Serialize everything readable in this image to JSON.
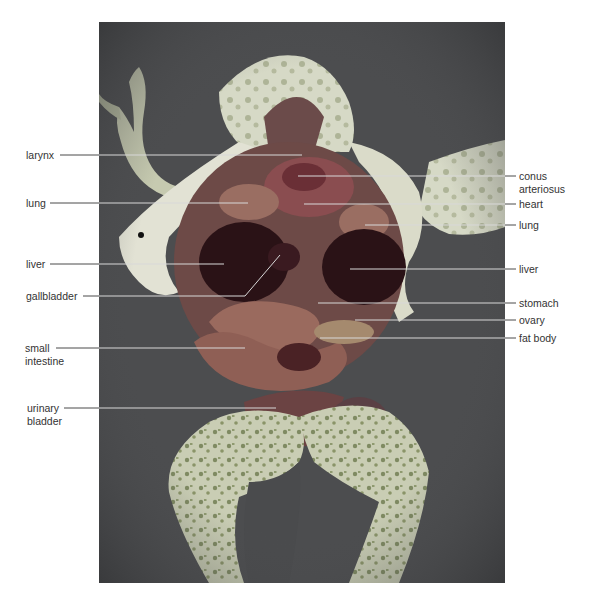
{
  "figure": {
    "colors": {
      "background": "#ffffff",
      "photo_background": "#4a4b4d",
      "skin": "#c9cdb4",
      "skin_spots": "#7f8a62",
      "organ_dark": "#2a1216",
      "organ_red": "#8a4a4a",
      "intestine": "#9a6a5e",
      "leader_line": "#4a4a4a",
      "leader_line_on_photo": "#d8d8d8"
    },
    "labels_left": [
      {
        "id": "larynx",
        "text": "larynx",
        "y": 155
      },
      {
        "id": "lung-left",
        "text": "lung",
        "y": 203
      },
      {
        "id": "liver-left",
        "text": "liver",
        "y": 264
      },
      {
        "id": "gallbladder",
        "text": "gallbladder",
        "y": 296
      },
      {
        "id": "small-intestine",
        "line1": "small",
        "line2": "intestine",
        "y": 348
      },
      {
        "id": "urinary-bladder",
        "line1": "urinary",
        "line2": "bladder",
        "y": 408
      }
    ],
    "labels_right": [
      {
        "id": "conus-arteriosus",
        "line1": "conus",
        "line2": "arteriosus",
        "y": 176
      },
      {
        "id": "heart",
        "text": "heart",
        "y": 204
      },
      {
        "id": "lung-right",
        "text": "lung",
        "y": 225
      },
      {
        "id": "liver-right",
        "text": "liver",
        "y": 269
      },
      {
        "id": "stomach",
        "text": "stomach",
        "y": 303
      },
      {
        "id": "ovary",
        "text": "ovary",
        "y": 320
      },
      {
        "id": "fat-body",
        "text": "fat body",
        "y": 338
      }
    ]
  }
}
